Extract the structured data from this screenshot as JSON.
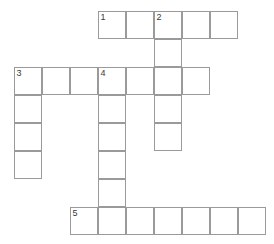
{
  "puzzle": {
    "title": "Crossword Grid",
    "cell_size": 28,
    "origin_x": 14,
    "origin_y": 11,
    "grid_cols": 9,
    "grid_rows": 8,
    "border_color": "#9a9a9a",
    "cell_fill": "#ffffff",
    "number_color": "#3a3a3a",
    "background": "#ffffff"
  },
  "entries": [
    {
      "number": "1",
      "direction": "across",
      "row": 0,
      "col": 3,
      "length": 5
    },
    {
      "number": "2",
      "direction": "down",
      "row": 0,
      "col": 5,
      "length": 5
    },
    {
      "number": "3",
      "direction": "across",
      "row": 2,
      "col": 0,
      "length": 7
    },
    {
      "number": "3",
      "direction": "down",
      "row": 2,
      "col": 0,
      "length": 4
    },
    {
      "number": "4",
      "direction": "down",
      "row": 2,
      "col": 3,
      "length": 6
    },
    {
      "number": "5",
      "direction": "across",
      "row": 7,
      "col": 2,
      "length": 7
    }
  ],
  "cells": [
    {
      "row": 0,
      "col": 3,
      "number": "1",
      "letter": ""
    },
    {
      "row": 0,
      "col": 4,
      "number": "",
      "letter": ""
    },
    {
      "row": 0,
      "col": 5,
      "number": "2",
      "letter": ""
    },
    {
      "row": 0,
      "col": 6,
      "number": "",
      "letter": ""
    },
    {
      "row": 0,
      "col": 7,
      "number": "",
      "letter": ""
    },
    {
      "row": 1,
      "col": 5,
      "number": "",
      "letter": ""
    },
    {
      "row": 2,
      "col": 0,
      "number": "3",
      "letter": ""
    },
    {
      "row": 2,
      "col": 1,
      "number": "",
      "letter": ""
    },
    {
      "row": 2,
      "col": 2,
      "number": "",
      "letter": ""
    },
    {
      "row": 2,
      "col": 3,
      "number": "4",
      "letter": ""
    },
    {
      "row": 2,
      "col": 4,
      "number": "",
      "letter": ""
    },
    {
      "row": 2,
      "col": 5,
      "number": "",
      "letter": ""
    },
    {
      "row": 2,
      "col": 6,
      "number": "",
      "letter": ""
    },
    {
      "row": 3,
      "col": 0,
      "number": "",
      "letter": ""
    },
    {
      "row": 3,
      "col": 3,
      "number": "",
      "letter": ""
    },
    {
      "row": 3,
      "col": 5,
      "number": "",
      "letter": ""
    },
    {
      "row": 4,
      "col": 0,
      "number": "",
      "letter": ""
    },
    {
      "row": 4,
      "col": 3,
      "number": "",
      "letter": ""
    },
    {
      "row": 4,
      "col": 5,
      "number": "",
      "letter": ""
    },
    {
      "row": 5,
      "col": 0,
      "number": "",
      "letter": ""
    },
    {
      "row": 5,
      "col": 3,
      "number": "",
      "letter": ""
    },
    {
      "row": 6,
      "col": 3,
      "number": "",
      "letter": ""
    },
    {
      "row": 7,
      "col": 2,
      "number": "5",
      "letter": ""
    },
    {
      "row": 7,
      "col": 3,
      "number": "",
      "letter": ""
    },
    {
      "row": 7,
      "col": 4,
      "number": "",
      "letter": ""
    },
    {
      "row": 7,
      "col": 5,
      "number": "",
      "letter": ""
    },
    {
      "row": 7,
      "col": 6,
      "number": "",
      "letter": ""
    },
    {
      "row": 7,
      "col": 7,
      "number": "",
      "letter": ""
    },
    {
      "row": 7,
      "col": 8,
      "number": "",
      "letter": ""
    }
  ]
}
